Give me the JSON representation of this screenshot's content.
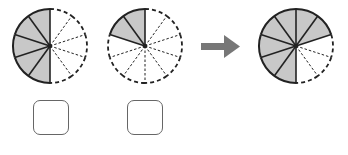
{
  "diagram": {
    "title": "",
    "divisions": 10,
    "colors": {
      "shaded": "#c8c8c8",
      "stroke": "#222222",
      "arrow": "#777777",
      "box_border": "#666666"
    },
    "circles": [
      {
        "id": "first",
        "cx": 50,
        "cy": 46,
        "r": 37,
        "shaded_slices": 5,
        "description": "left half shaded (5 of 10)"
      },
      {
        "id": "second",
        "cx": 145,
        "cy": 46,
        "r": 37,
        "shaded_slices": 2,
        "description": "2 of 10 shaded, top-left"
      },
      {
        "id": "result",
        "cx": 296,
        "cy": 46,
        "r": 37,
        "shaded_slices": 7,
        "description": "7 of 10 shaded"
      }
    ],
    "arrow": {
      "direction": "right"
    },
    "answer_boxes": [
      {
        "id": "box-1",
        "value": ""
      },
      {
        "id": "box-2",
        "value": ""
      }
    ]
  }
}
